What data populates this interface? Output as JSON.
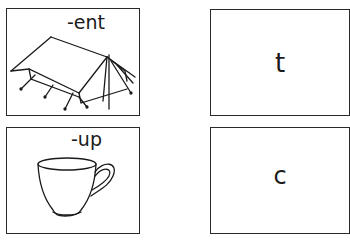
{
  "worksheet": {
    "rows": [
      {
        "picture": {
          "label": "-ent",
          "icon": "tent-icon"
        },
        "answer": {
          "letter": "t"
        }
      },
      {
        "picture": {
          "label": "-up",
          "icon": "cup-icon"
        },
        "answer": {
          "letter": "c"
        }
      }
    ]
  }
}
